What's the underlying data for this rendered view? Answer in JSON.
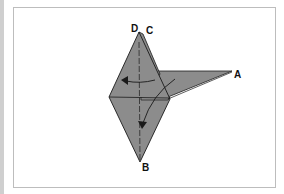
{
  "figure": {
    "type": "origami folding diagram",
    "labels": {
      "A": "A",
      "B": "B",
      "C": "C",
      "D": "D"
    },
    "colors": {
      "paper_fill": "#8c8c8c",
      "line": "#1a1a1a",
      "frame_border": "#bdbdbd",
      "background": "#ffffff"
    },
    "arrows": [
      {
        "name": "fold-left-arrow",
        "direction": "left"
      },
      {
        "name": "fold-down-arrow",
        "direction": "down-left"
      }
    ]
  }
}
